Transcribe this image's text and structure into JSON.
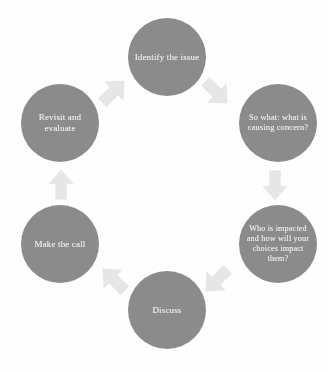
{
  "diagram": {
    "type": "cycle",
    "title": "",
    "node_fill_color": "#8b8b8b",
    "node_text_color": "#f2f2f0",
    "arrow_fill_color": "#e3e3e1",
    "background_color": "#ffffff",
    "nodes": [
      {
        "id": "identify",
        "label": "Identify the issue",
        "position": "top"
      },
      {
        "id": "sowhat",
        "label": "So what: what is causing concern?",
        "position": "top-right"
      },
      {
        "id": "who",
        "label": "Who is impacted and how will your choices impact them?",
        "position": "bottom-right"
      },
      {
        "id": "discuss",
        "label": "Discuss",
        "position": "bottom"
      },
      {
        "id": "makecall",
        "label": "Make the call",
        "position": "bottom-left"
      },
      {
        "id": "revisit",
        "label": "Revisit and evaluate",
        "position": "top-left"
      }
    ],
    "arrows": [
      {
        "id": "identify-to-sowhat",
        "from": "identify",
        "to": "sowhat",
        "direction": "south-east",
        "glyph": "block-arrow-icon"
      },
      {
        "id": "sowhat-to-who",
        "from": "sowhat",
        "to": "who",
        "direction": "south",
        "glyph": "block-arrow-icon"
      },
      {
        "id": "who-to-discuss",
        "from": "who",
        "to": "discuss",
        "direction": "south-west",
        "glyph": "block-arrow-icon"
      },
      {
        "id": "discuss-to-makecall",
        "from": "discuss",
        "to": "makecall",
        "direction": "north-west",
        "glyph": "block-arrow-icon"
      },
      {
        "id": "makecall-to-revisit",
        "from": "makecall",
        "to": "revisit",
        "direction": "north",
        "glyph": "block-arrow-icon"
      },
      {
        "id": "revisit-to-identify",
        "from": "revisit",
        "to": "identify",
        "direction": "north-east",
        "glyph": "block-arrow-icon"
      }
    ]
  }
}
